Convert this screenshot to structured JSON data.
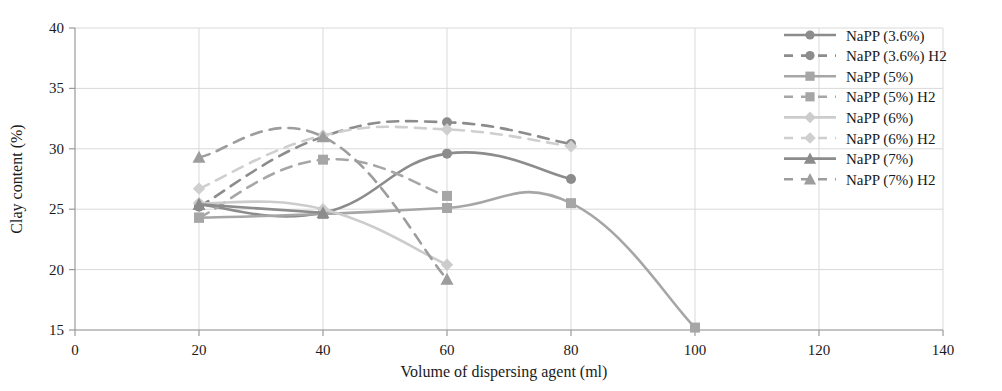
{
  "chart_data": {
    "type": "line",
    "title": "",
    "xlabel": "Volume of dispersing agent (ml)",
    "ylabel": "Clay content (%)",
    "xlim": [
      0,
      140
    ],
    "ylim": [
      15,
      40
    ],
    "xticks": [
      0,
      20,
      40,
      60,
      80,
      100,
      120,
      140
    ],
    "yticks": [
      15,
      20,
      25,
      30,
      35,
      40
    ],
    "grid": true,
    "legend_position": "right",
    "series": [
      {
        "name": "NaPP (3.6%)",
        "marker": "circle",
        "style": "solid",
        "color": "#8c8c8c",
        "x": [
          20,
          40,
          60,
          80
        ],
        "y": [
          25.4,
          24.7,
          29.6,
          27.5
        ]
      },
      {
        "name": "NaPP (3.6%) H2",
        "marker": "circle",
        "style": "dashed",
        "color": "#8c8c8c",
        "x": [
          20,
          40,
          60,
          80
        ],
        "y": [
          25.2,
          31.0,
          32.2,
          30.4
        ]
      },
      {
        "name": "NaPP (5%)",
        "marker": "square",
        "style": "solid",
        "color": "#a6a6a6",
        "x": [
          20,
          40,
          60,
          80,
          100
        ],
        "y": [
          24.3,
          24.6,
          25.1,
          25.5,
          15.2
        ]
      },
      {
        "name": "NaPP (5%) H2",
        "marker": "square",
        "style": "dashed",
        "color": "#a6a6a6",
        "x": [
          20,
          40,
          60
        ],
        "y": [
          24.3,
          29.1,
          26.1
        ]
      },
      {
        "name": "NaPP (6%)",
        "marker": "diamond",
        "style": "solid",
        "color": "#cccccc",
        "x": [
          20,
          40,
          60
        ],
        "y": [
          25.5,
          25.0,
          20.4
        ]
      },
      {
        "name": "NaPP (6%) H2",
        "marker": "diamond",
        "style": "dashed",
        "color": "#cfcfcf",
        "x": [
          20,
          40,
          60,
          80
        ],
        "y": [
          26.7,
          31.1,
          31.6,
          30.2
        ]
      },
      {
        "name": "NaPP (7%)",
        "marker": "triangle",
        "style": "solid",
        "color": "#8c8c8c",
        "x": [
          20,
          40
        ],
        "y": [
          25.4,
          24.7
        ]
      },
      {
        "name": "NaPP (7%) H2",
        "marker": "triangle",
        "style": "dashed",
        "color": "#9d9d9d",
        "x": [
          20,
          40,
          60
        ],
        "y": [
          29.3,
          31.0,
          19.2
        ]
      }
    ]
  }
}
